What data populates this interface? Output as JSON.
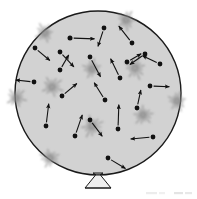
{
  "figure": {
    "colors": {
      "page_background": "#ffffff",
      "vessel_fill": "#d2d2d2",
      "vessel_stroke": "#1a1a1a",
      "particle": "#111111",
      "arrow": "#111111",
      "burst": "#8a8a8a",
      "stand": "#bfbfbf",
      "caption_faint": "#e2e2e2"
    },
    "vessel": {
      "label": "gas-vessel",
      "center_x": 98,
      "center_y": 93,
      "radius_x": 83,
      "radius_y": 82,
      "stroke_width": 1.4
    },
    "stand": {
      "label": "vessel-stand",
      "neck_x": 98,
      "neck_y": 175,
      "base_half_width": 13,
      "base_y": 188
    },
    "particles": [
      {
        "name": "particle-1",
        "x": 70,
        "y": 38,
        "r": 2.5,
        "angle": 2,
        "len": 22
      },
      {
        "name": "particle-2",
        "x": 104,
        "y": 28,
        "r": 2.4,
        "angle": 108,
        "len": 17
      },
      {
        "name": "particle-3",
        "x": 132,
        "y": 43,
        "r": 2.4,
        "angle": 232,
        "len": 19
      },
      {
        "name": "particle-4",
        "x": 60,
        "y": 52,
        "r": 2.4,
        "angle": 47,
        "len": 18
      },
      {
        "name": "particle-5",
        "x": 90,
        "y": 57,
        "r": 2.4,
        "angle": 62,
        "len": 20
      },
      {
        "name": "particle-6",
        "x": 145,
        "y": 54,
        "r": 2.4,
        "angle": 145,
        "len": 16
      },
      {
        "name": "particle-7",
        "x": 35,
        "y": 48,
        "r": 2.4,
        "angle": 40,
        "len": 17
      },
      {
        "name": "particle-8",
        "x": 160,
        "y": 64,
        "r": 2.4,
        "angle": 205,
        "len": 17
      },
      {
        "name": "particle-9",
        "x": 34,
        "y": 82,
        "r": 2.4,
        "angle": 186,
        "len": 16
      },
      {
        "name": "particle-10",
        "x": 120,
        "y": 78,
        "r": 2.4,
        "angle": 244,
        "len": 19
      },
      {
        "name": "particle-11",
        "x": 150,
        "y": 86,
        "r": 2.4,
        "angle": 2,
        "len": 17
      },
      {
        "name": "particle-12",
        "x": 62,
        "y": 96,
        "r": 2.4,
        "angle": 320,
        "len": 17
      },
      {
        "name": "particle-13",
        "x": 105,
        "y": 100,
        "r": 2.4,
        "angle": 238,
        "len": 18
      },
      {
        "name": "particle-14",
        "x": 137,
        "y": 108,
        "r": 2.4,
        "angle": 282,
        "len": 16
      },
      {
        "name": "particle-15",
        "x": 90,
        "y": 120,
        "r": 2.4,
        "angle": 53,
        "len": 18
      },
      {
        "name": "particle-16",
        "x": 46,
        "y": 126,
        "r": 2.4,
        "angle": 277,
        "len": 20
      },
      {
        "name": "particle-17",
        "x": 75,
        "y": 136,
        "r": 2.4,
        "angle": 289,
        "len": 20
      },
      {
        "name": "particle-18",
        "x": 118,
        "y": 129,
        "r": 2.4,
        "angle": 272,
        "len": 22
      },
      {
        "name": "particle-19",
        "x": 153,
        "y": 137,
        "r": 2.4,
        "angle": 175,
        "len": 20
      },
      {
        "name": "particle-20",
        "x": 108,
        "y": 158,
        "r": 2.4,
        "angle": 31,
        "len": 18
      },
      {
        "name": "particle-21",
        "x": 60,
        "y": 70,
        "r": 2.4,
        "angle": 300,
        "len": 15
      },
      {
        "name": "particle-22",
        "x": 127,
        "y": 62,
        "r": 2.4,
        "angle": 330,
        "len": 14
      }
    ],
    "interior_bursts": [
      {
        "name": "burst-interior-1",
        "x": 92,
        "y": 69,
        "size": 13
      },
      {
        "name": "burst-interior-2",
        "x": 52,
        "y": 87,
        "size": 14
      },
      {
        "name": "burst-interior-3",
        "x": 135,
        "y": 68,
        "size": 15
      },
      {
        "name": "burst-interior-4",
        "x": 143,
        "y": 115,
        "size": 13
      },
      {
        "name": "burst-interior-5",
        "x": 92,
        "y": 126,
        "size": 15
      }
    ],
    "wall_bursts": [
      {
        "name": "burst-wall-top-left",
        "x": 45,
        "y": 33,
        "size": 13
      },
      {
        "name": "burst-wall-top-right",
        "x": 126,
        "y": 20,
        "size": 13
      },
      {
        "name": "burst-wall-left",
        "x": 16,
        "y": 98,
        "size": 13
      },
      {
        "name": "burst-wall-right",
        "x": 177,
        "y": 101,
        "size": 13
      },
      {
        "name": "burst-wall-bottom-left",
        "x": 50,
        "y": 158,
        "size": 13
      }
    ],
    "caption": {
      "name": "faint-caption-artifact",
      "legible": false,
      "text": ""
    }
  }
}
